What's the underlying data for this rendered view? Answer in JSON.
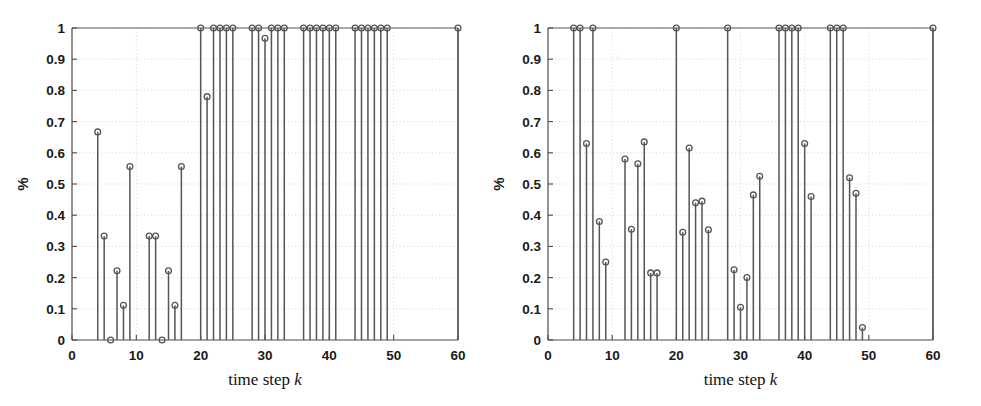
{
  "figure": {
    "type": "two-panel-stem-plot",
    "background_color": "#ffffff",
    "ink_color": "#555555",
    "grid_color": "#c8c8c8",
    "axis_color": "#4a4a4a"
  },
  "axes": {
    "y_label": "%",
    "x_label_text": "time step ",
    "x_label_var": "k",
    "x_ticks": [
      0,
      10,
      20,
      30,
      40,
      50,
      60
    ],
    "x_tick_labels": [
      "0",
      "10",
      "20",
      "30",
      "40",
      "50",
      "60"
    ],
    "y_ticks": [
      0,
      0.1,
      0.2,
      0.3,
      0.4,
      0.5,
      0.6,
      0.7,
      0.8,
      0.9,
      1
    ],
    "y_tick_labels": [
      "0",
      "0.1",
      "0.2",
      "0.3",
      "0.4",
      "0.5",
      "0.6",
      "0.7",
      "0.8",
      "0.9",
      "1"
    ],
    "xlim": [
      0,
      60
    ],
    "ylim": [
      0,
      1
    ]
  },
  "chart_data": [
    {
      "type": "line",
      "subtype": "stem",
      "panel": "left",
      "title": "",
      "xlabel": "time step k",
      "ylabel": "%",
      "xlim": [
        0,
        60
      ],
      "ylim": [
        0,
        1
      ],
      "grid": true,
      "marker": "circle-open",
      "x": [
        4,
        5,
        6,
        7,
        8,
        9,
        12,
        13,
        14,
        15,
        16,
        17,
        20,
        21,
        22,
        23,
        24,
        25,
        28,
        29,
        30,
        31,
        32,
        33,
        36,
        37,
        38,
        39,
        40,
        41,
        44,
        45,
        46,
        47,
        48,
        49,
        60
      ],
      "values": [
        0.667,
        0.333,
        0.0,
        0.222,
        0.111,
        0.556,
        0.333,
        0.333,
        0.0,
        0.222,
        0.111,
        0.556,
        1.0,
        0.78,
        1.0,
        1.0,
        1.0,
        1.0,
        1.0,
        1.0,
        0.967,
        1.0,
        1.0,
        1.0,
        1.0,
        1.0,
        1.0,
        1.0,
        1.0,
        1.0,
        1.0,
        1.0,
        1.0,
        1.0,
        1.0,
        1.0,
        1.0
      ]
    },
    {
      "type": "line",
      "subtype": "stem",
      "panel": "right",
      "title": "",
      "xlabel": "time step k",
      "ylabel": "%",
      "xlim": [
        0,
        60
      ],
      "ylim": [
        0,
        1
      ],
      "grid": true,
      "marker": "circle-open",
      "x": [
        4,
        5,
        6,
        7,
        8,
        9,
        12,
        13,
        14,
        15,
        16,
        17,
        20,
        21,
        22,
        23,
        24,
        25,
        28,
        29,
        30,
        31,
        32,
        33,
        36,
        37,
        38,
        39,
        40,
        41,
        44,
        45,
        46,
        47,
        48,
        49,
        60
      ],
      "values": [
        1.0,
        1.0,
        0.63,
        1.0,
        0.38,
        0.25,
        0.58,
        0.355,
        0.565,
        0.635,
        0.215,
        0.215,
        1.0,
        0.345,
        0.615,
        0.44,
        0.445,
        0.353,
        1.0,
        0.225,
        0.105,
        0.2,
        0.465,
        0.525,
        1.0,
        1.0,
        1.0,
        1.0,
        0.63,
        0.46,
        1.0,
        1.0,
        1.0,
        0.52,
        0.47,
        0.04,
        1.0
      ]
    }
  ]
}
